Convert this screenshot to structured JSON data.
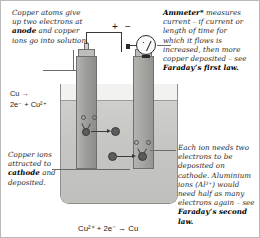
{
  "figure": {
    "frame_color": "#b9b9b9",
    "background": "#ffffff"
  },
  "annotations": {
    "anode_note": {
      "line1": "Copper atoms give",
      "line2": "up two electrons at",
      "bold1": "anode",
      "line3_rest": " and copper",
      "line4": "ions go into solution."
    },
    "ammeter_note": {
      "bold1": "Ammeter*",
      "rest1": " measures",
      "line2": "current – if current or",
      "line3": "length of time for",
      "line4": "which it flows is",
      "line5": "increased, then more",
      "line6": "copper deposited – see",
      "bold2": "Faraday’s first law."
    },
    "cathode_note": {
      "line1": "Copper ions",
      "line2": "attracted to",
      "bold1": "cathode",
      "line3_rest": " and",
      "line4": "deposited."
    },
    "second_law_note": {
      "line1": "Each ion needs two",
      "line2": "electrons to be",
      "line3": "deposited on",
      "line4": "cathode. Aluminium",
      "line5": "ions (Al³⁺) would",
      "line6": "need half as many",
      "line7": "electrons again – see",
      "bold1": "Faraday’s second",
      "bold2": "law."
    }
  },
  "equations": {
    "anode_line1": "Cu →",
    "anode_line2": "2e⁻ + Cu²⁺",
    "overall": "Cu²⁺ + 2e⁻ → Cu"
  },
  "circuit": {
    "battery_positive": "+",
    "battery_negative": "−",
    "ammeter_symbol": "A"
  },
  "colors": {
    "solution": "#c6c6c2",
    "electrode": "#9e9e9b",
    "ion": "#5c5c5c",
    "wire": "#3a3a3a",
    "leader": "#6b6b6b",
    "text": "#2b2b2b"
  }
}
